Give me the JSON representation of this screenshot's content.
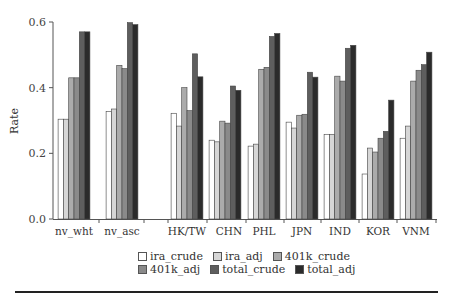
{
  "chart_data": {
    "type": "bar",
    "title": "",
    "xlabel": "",
    "ylabel": "Rate",
    "ylim": [
      0,
      0.6
    ],
    "yticks": [
      "0.0",
      "0.2",
      "0.4",
      "0.6"
    ],
    "grid": false,
    "legend_position": "bottom",
    "categories": [
      "nv_wht",
      "nv_asc",
      "",
      "HK/TW",
      "CHN",
      "PHL",
      "JPN",
      "IND",
      "KOR",
      "VNM"
    ],
    "series": [
      {
        "name": "ira_crude",
        "color": "#ffffff",
        "values": [
          0.304,
          0.328,
          null,
          0.322,
          0.24,
          0.222,
          0.295,
          0.258,
          0.137,
          0.246
        ]
      },
      {
        "name": "ira_adj",
        "color": "#d6d6d6",
        "values": [
          0.304,
          0.335,
          null,
          0.283,
          0.235,
          0.228,
          0.277,
          0.258,
          0.216,
          0.283
        ]
      },
      {
        "name": "401k_crude",
        "color": "#ababab",
        "values": [
          0.43,
          0.468,
          null,
          0.4,
          0.298,
          0.456,
          0.316,
          0.435,
          0.204,
          0.42
        ]
      },
      {
        "name": "401k_adj",
        "color": "#8a8a8a",
        "values": [
          0.43,
          0.458,
          null,
          0.33,
          0.292,
          0.462,
          0.319,
          0.42,
          0.246,
          0.453
        ]
      },
      {
        "name": "total_crude",
        "color": "#5e5e5e",
        "values": [
          0.57,
          0.598,
          null,
          0.503,
          0.405,
          0.556,
          0.447,
          0.52,
          0.267,
          0.47
        ]
      },
      {
        "name": "total_adj",
        "color": "#2b2b2b",
        "values": [
          0.57,
          0.592,
          null,
          0.433,
          0.392,
          0.565,
          0.432,
          0.529,
          0.362,
          0.508
        ]
      }
    ]
  },
  "legend": {
    "items": [
      {
        "label": "ira_crude",
        "color": "#ffffff"
      },
      {
        "label": "ira_adj",
        "color": "#d6d6d6"
      },
      {
        "label": "401k_crude",
        "color": "#ababab"
      },
      {
        "label": "401k_adj",
        "color": "#8a8a8a"
      },
      {
        "label": "total_crude",
        "color": "#5e5e5e"
      },
      {
        "label": "total_adj",
        "color": "#2b2b2b"
      }
    ]
  }
}
